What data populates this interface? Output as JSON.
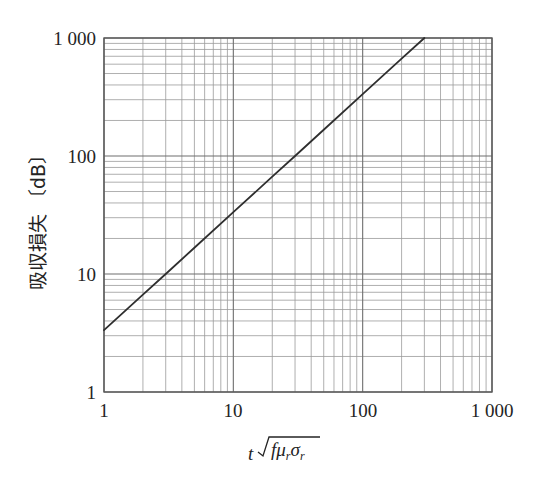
{
  "figure": {
    "background_color": "#ffffff",
    "plot_border_color": "#5a5a5a",
    "major_grid_color": "#6e6e6e",
    "minor_grid_color": "#9a9a9a",
    "series_color": "#2e2e2e"
  },
  "axes": {
    "x": {
      "title_prefix": "t",
      "title_radicand": "fμ",
      "title_sub1": "r",
      "title_radicand2": "σ",
      "title_sub2": "r",
      "title_plain": "t√(fμᵣσᵣ)",
      "scale": "log",
      "min": 1,
      "max": 1000,
      "tick_labels": [
        "1",
        "10",
        "100",
        "1 000"
      ],
      "tick_values": [
        1,
        10,
        100,
        1000
      ]
    },
    "y": {
      "title": "吸収損失",
      "unit_open": "〔",
      "unit": "dB",
      "unit_close": "〕",
      "title_full": "吸収損失 〔dB〕",
      "scale": "log",
      "min": 1,
      "max": 1000,
      "tick_labels": [
        "1",
        "10",
        "100",
        "1 000"
      ],
      "tick_values": [
        1,
        10,
        100,
        1000
      ]
    }
  },
  "chart_data": {
    "type": "line",
    "title": "",
    "xlabel": "t√(fμᵣσᵣ)",
    "ylabel": "吸収損失 〔dB〕",
    "xscale": "log",
    "yscale": "log",
    "xlim": [
      1,
      1000
    ],
    "ylim": [
      1,
      1000
    ],
    "grid": true,
    "minor_grid": true,
    "legend": false,
    "legend_position": "none",
    "series": [
      {
        "name": "吸収損失",
        "color": "#2e2e2e",
        "x": [
          1,
          2,
          3,
          5,
          10,
          20,
          30,
          50,
          100,
          200,
          300
        ],
        "y": [
          3.34,
          6.68,
          10.0,
          16.7,
          33.4,
          66.8,
          100,
          167,
          334,
          668,
          1000
        ]
      }
    ],
    "annotations": []
  },
  "minor_ticks_per_decade": [
    2,
    3,
    4,
    5,
    6,
    7,
    8,
    9
  ]
}
